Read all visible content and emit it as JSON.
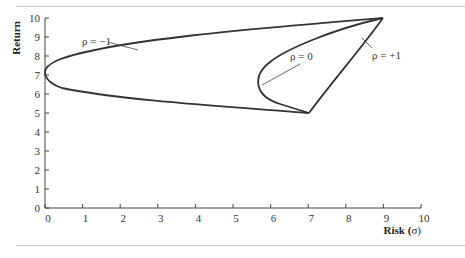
{
  "chart_data": {
    "type": "line",
    "title": "",
    "xlabel": "Risk (σ)",
    "ylabel": "Return",
    "xlim": [
      0,
      10
    ],
    "ylim": [
      0,
      10
    ],
    "xticks": [
      "0",
      "1",
      "2",
      "3",
      "4",
      "5",
      "6",
      "7",
      "8",
      "9",
      "10"
    ],
    "yticks": [
      "0",
      "1",
      "2",
      "3",
      "4",
      "5",
      "6",
      "7",
      "8",
      "9",
      "10"
    ],
    "grid": false,
    "assets": [
      {
        "name": "Asset A",
        "risk": 7,
        "return": 5
      },
      {
        "name": "Asset B",
        "risk": 9,
        "return": 10
      }
    ],
    "series": [
      {
        "name": "ρ = −1",
        "label": "ρ = −1",
        "x": [
          7,
          5.25,
          3.5,
          1.75,
          0,
          1.0,
          2.5,
          4.5,
          6.75,
          9
        ],
        "y": [
          5,
          5.3,
          5.6,
          6.0,
          6.75,
          7.2,
          7.9,
          8.7,
          9.4,
          10
        ]
      },
      {
        "name": "ρ = 0",
        "label": "ρ = 0",
        "x": [
          7,
          6.3,
          5.8,
          5.6,
          5.9,
          6.6,
          7.6,
          9
        ],
        "y": [
          5,
          5.5,
          6.0,
          6.5,
          7.3,
          8.2,
          9.1,
          10
        ]
      },
      {
        "name": "ρ = +1",
        "label": "ρ = +1",
        "x": [
          7,
          9
        ],
        "y": [
          5,
          10
        ]
      }
    ]
  },
  "labels": {
    "rho_neg1": "ρ = −1",
    "rho_0": "ρ = 0",
    "rho_pos1": "ρ = +1",
    "xlabel_main": "Risk (",
    "xlabel_sigma": "σ",
    "xlabel_close": ")",
    "ylabel": "Return"
  }
}
